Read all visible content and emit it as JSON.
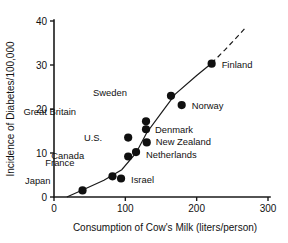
{
  "chart_data": {
    "type": "scatter",
    "title": "",
    "xlabel": "Consumption of Cow's Milk (liters/person)",
    "ylabel": "Incidence of Diabetes/100,000",
    "xlim": [
      0,
      300
    ],
    "ylim": [
      0,
      40
    ],
    "xticks": [
      "0",
      "100",
      "200",
      "300"
    ],
    "xtick_values": [
      0,
      100,
      200,
      300
    ],
    "yticks": [
      "0",
      "10",
      "20",
      "30",
      "40"
    ],
    "ytick_values": [
      0,
      10,
      20,
      30,
      40
    ],
    "grid": false,
    "legend": "none",
    "point_label_field": "country",
    "annotations": [
      "trend curve fitted through points, dashed beyond Finland"
    ],
    "points": [
      {
        "country": "Japan",
        "x": 40,
        "y": 1.5,
        "label_dx": -32,
        "label_dy": -6
      },
      {
        "country": "France",
        "x": 82,
        "y": 4.7,
        "label_dx": -38,
        "label_dy": -10
      },
      {
        "country": "Israel",
        "x": 94,
        "y": 4.2,
        "label_dx": 10,
        "label_dy": 4
      },
      {
        "country": "Canada",
        "x": 104,
        "y": 9.2,
        "label_dx": -44,
        "label_dy": 2
      },
      {
        "country": "Netherlands",
        "x": 115,
        "y": 10.2,
        "label_dx": 10,
        "label_dy": 6
      },
      {
        "country": "U.S.",
        "x": 104,
        "y": 13.5,
        "label_dx": -26,
        "label_dy": 3
      },
      {
        "country": "Great Britain",
        "x": 129,
        "y": 17.2,
        "label_dx": -70,
        "label_dy": -6
      },
      {
        "country": "Denmark",
        "x": 129,
        "y": 15.4,
        "label_dx": 9,
        "label_dy": 4
      },
      {
        "country": "New Zealand",
        "x": 130,
        "y": 12.4,
        "label_dx": 9,
        "label_dy": 3
      },
      {
        "country": "Sweden",
        "x": 164,
        "y": 23.0,
        "label_dx": -44,
        "label_dy": 0
      },
      {
        "country": "Norway",
        "x": 179,
        "y": 20.9,
        "label_dx": 10,
        "label_dy": 4
      },
      {
        "country": "Finland",
        "x": 221,
        "y": 30.3,
        "label_dx": 10,
        "label_dy": 4
      }
    ]
  },
  "colors": {
    "ink": "#101010",
    "background": "#ffffff"
  }
}
